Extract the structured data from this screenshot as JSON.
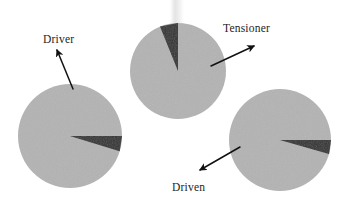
{
  "figure": {
    "kind": "mechanical-pulley-belt-diagram",
    "background_color": "#ffffff"
  },
  "colors": {
    "pulley_fill": "#b3b3b3",
    "pulley_fill_alt": "#b8b8b8",
    "wedge_fill": "#303030",
    "arrow_color": "#111111",
    "label_color": "#1d1d1d",
    "shaft_color": "#e8e8e8"
  },
  "labels": {
    "driver": "Driver",
    "tensioner": "Tensioner",
    "driven": "Driven"
  },
  "pulleys": [
    {
      "name": "driver-pulley",
      "label": "Driver",
      "cx": 70,
      "cy": 136,
      "r": 52,
      "wedge": {
        "apex_x": 70,
        "apex_y": 136,
        "start_angle_deg": 0,
        "end_angle_deg": -17,
        "direction": "right"
      }
    },
    {
      "name": "tensioner-pulley",
      "label": "Tensioner",
      "cx": 178,
      "cy": 71,
      "r": 48,
      "wedge": {
        "apex_x": 178,
        "apex_y": 71,
        "start_angle_deg": 90,
        "end_angle_deg": 112,
        "direction": "down"
      }
    },
    {
      "name": "driven-pulley",
      "label": "Driven",
      "cx": 280,
      "cy": 140,
      "r": 51,
      "wedge": {
        "apex_x": 280,
        "apex_y": 140,
        "start_angle_deg": 0,
        "end_angle_deg": -16,
        "direction": "right"
      }
    }
  ],
  "shaft": {
    "name": "tensioner-shaft",
    "x": 170,
    "y": 0,
    "width": 14,
    "height": 34
  },
  "arrows": [
    {
      "name": "driver-arrow",
      "label": "Driver",
      "x1": 73,
      "y1": 89,
      "x2": 57,
      "y2": 50,
      "points_to": "driver-pulley"
    },
    {
      "name": "tensioner-arrow",
      "label": "Tensioner",
      "x1": 211,
      "y1": 66,
      "x2": 254,
      "y2": 46,
      "points_to": "tensioner-pulley"
    },
    {
      "name": "driven-arrow",
      "label": "Driven",
      "x1": 240,
      "y1": 147,
      "x2": 200,
      "y2": 170,
      "points_to": "driven-pulley"
    }
  ]
}
